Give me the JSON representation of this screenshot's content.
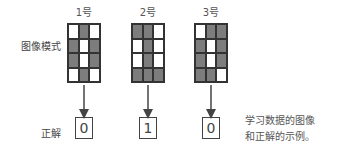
{
  "row_labels": {
    "pattern": "图像模式",
    "answer": "正解"
  },
  "samples": [
    {
      "label": "1号",
      "answer": "0",
      "pattern": [
        [
          0,
          1,
          0
        ],
        [
          1,
          0,
          1
        ],
        [
          1,
          0,
          1
        ],
        [
          0,
          1,
          0
        ]
      ]
    },
    {
      "label": "2号",
      "answer": "1",
      "pattern": [
        [
          1,
          1,
          0
        ],
        [
          0,
          1,
          0
        ],
        [
          0,
          1,
          0
        ],
        [
          1,
          1,
          1
        ]
      ]
    },
    {
      "label": "3号",
      "answer": "0",
      "pattern": [
        [
          0,
          1,
          1
        ],
        [
          1,
          0,
          1
        ],
        [
          1,
          0,
          1
        ],
        [
          1,
          1,
          0
        ]
      ]
    }
  ],
  "caption": [
    "学习数据的图像",
    "和正解的示例。"
  ],
  "colors": {
    "filled": "#7d7d7d",
    "empty": "#ffffff",
    "line": "#333333"
  }
}
